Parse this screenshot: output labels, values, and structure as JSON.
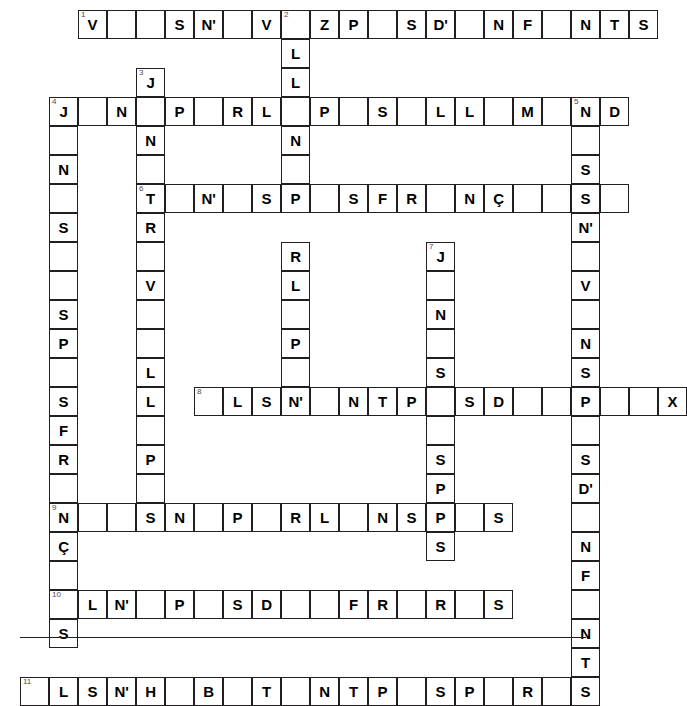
{
  "meta": {
    "grid": {
      "cell_size": 29,
      "origin_x": 20,
      "origin_y": 10,
      "columns": 20,
      "rows": 21
    },
    "colors": {
      "cell_border": "#231f20",
      "cell_fill": "#ffffff",
      "letter": "#000000",
      "clue_number": "#4a4a4a",
      "page_background": "#ffffff"
    }
  },
  "footer": {
    "rule": "horizontal-rule"
  },
  "entries": [
    {
      "label": "across-1",
      "number": "1",
      "row": 0,
      "col": 2,
      "direction": "across",
      "letters": [
        "V",
        "",
        "",
        "S",
        "N'",
        "",
        "V",
        "",
        "Z",
        "P",
        "",
        "S",
        "D'",
        "",
        "N",
        "F",
        "",
        "N",
        "T",
        "S"
      ]
    },
    {
      "label": "across-4",
      "number": "4",
      "row": 3,
      "col": 1,
      "direction": "across",
      "letters": [
        "J",
        "",
        "N",
        "",
        "P",
        "",
        "R",
        "L",
        "",
        "P",
        "",
        "S",
        "",
        "L",
        "L",
        "",
        "M",
        "",
        "N",
        "D"
      ]
    },
    {
      "label": "across-6",
      "number": "6",
      "row": 5,
      "col": 3,
      "direction": "across",
      "letters": [
        "T",
        "",
        "N'",
        "",
        "S",
        "P",
        "",
        "S",
        "F",
        "R",
        "",
        "N",
        "Ç",
        "",
        "",
        "S"
      ]
    },
    {
      "label": "across-8",
      "number": "8",
      "row": 11,
      "col": 5,
      "direction": "across",
      "letters": [
        "",
        "L",
        "S",
        "N'",
        "",
        "N",
        "T",
        "P",
        "",
        "S",
        "D",
        "",
        "P",
        "",
        "",
        "X"
      ]
    },
    {
      "label": "across-9",
      "number": "9",
      "row": 14,
      "col": 1,
      "direction": "across",
      "letters": [
        "N",
        "",
        "",
        "S",
        "N",
        "",
        "P",
        "",
        "R",
        "L",
        "",
        "N",
        "S",
        "P",
        "",
        "S"
      ]
    },
    {
      "label": "across-10",
      "number": "10",
      "row": 17,
      "col": 1,
      "direction": "across",
      "letters": [
        "",
        "L",
        "N'",
        "",
        "P",
        "",
        "S",
        "D",
        "",
        "",
        "F",
        "R",
        "",
        "R",
        "",
        "S"
      ]
    },
    {
      "label": "across-11",
      "number": "11",
      "row": 20,
      "col": 0,
      "direction": "across",
      "letters": [
        "",
        "L",
        "S",
        "N'",
        "H",
        "",
        "B",
        "",
        "T",
        "",
        "N",
        "T",
        "P",
        "",
        "S",
        "P",
        "",
        "R",
        "",
        "S"
      ]
    },
    {
      "label": "down-2",
      "number": "2",
      "row": 0,
      "col": 7,
      "direction": "down",
      "letters": [
        "",
        "L",
        "L",
        "",
        "N",
        "",
        "",
        "P",
        "",
        "",
        "R",
        "L",
        "",
        "P",
        "",
        "S"
      ]
    },
    {
      "label": "down-3",
      "number": "3",
      "row": 2,
      "col": 3,
      "direction": "down",
      "letters": [
        "J",
        "",
        "N",
        "",
        "T",
        "R",
        "",
        "V",
        "",
        "",
        "L",
        "L",
        "",
        "P",
        "",
        "S"
      ]
    },
    {
      "label": "down-4",
      "number": "4",
      "row": 3,
      "col": 1,
      "direction": "down",
      "letters": [
        "J",
        "",
        "N",
        "",
        "S",
        "",
        "",
        "S",
        "P",
        "",
        "S",
        "F",
        "R",
        "",
        "N",
        "Ç",
        "",
        "",
        "S"
      ]
    },
    {
      "label": "down-5",
      "number": "5",
      "row": 3,
      "col": 17,
      "direction": "down",
      "letters": [
        "N",
        "",
        "S",
        "N'",
        "",
        "V",
        "",
        "N",
        "S",
        "",
        "P",
        "",
        "",
        "S",
        "D'",
        "",
        "N",
        "F",
        "",
        "N",
        "T",
        "S"
      ]
    },
    {
      "label": "down-7",
      "number": "7",
      "row": 7,
      "col": 12,
      "direction": "down",
      "letters": [
        "J",
        "",
        "N",
        "",
        "S",
        "",
        "",
        "",
        "S",
        "P",
        "",
        "S",
        "",
        "",
        "S"
      ]
    }
  ],
  "cells": [
    {
      "r": 0,
      "c": 2,
      "n": "1",
      "l": "V"
    },
    {
      "r": 0,
      "c": 3,
      "n": "",
      "l": ""
    },
    {
      "r": 0,
      "c": 4,
      "n": "",
      "l": ""
    },
    {
      "r": 0,
      "c": 5,
      "n": "",
      "l": "S"
    },
    {
      "r": 0,
      "c": 6,
      "n": "",
      "l": "N'"
    },
    {
      "r": 0,
      "c": 7,
      "n": "",
      "l": ""
    },
    {
      "r": 0,
      "c": 8,
      "n": "",
      "l": "V"
    },
    {
      "r": 0,
      "c": 9,
      "n": "2",
      "l": ""
    },
    {
      "r": 0,
      "c": 10,
      "n": "",
      "l": "Z"
    },
    {
      "r": 0,
      "c": 11,
      "n": "",
      "l": "P"
    },
    {
      "r": 0,
      "c": 12,
      "n": "",
      "l": ""
    },
    {
      "r": 0,
      "c": 13,
      "n": "",
      "l": "S"
    },
    {
      "r": 0,
      "c": 14,
      "n": "",
      "l": "D'"
    },
    {
      "r": 0,
      "c": 15,
      "n": "",
      "l": ""
    },
    {
      "r": 0,
      "c": 16,
      "n": "",
      "l": "N"
    },
    {
      "r": 0,
      "c": 17,
      "n": "",
      "l": "F"
    },
    {
      "r": 0,
      "c": 18,
      "n": "",
      "l": ""
    },
    {
      "r": 0,
      "c": 19,
      "n": "",
      "l": "N"
    },
    {
      "r": 0,
      "c": 20,
      "n": "",
      "l": "T"
    },
    {
      "r": 0,
      "c": 21,
      "n": "",
      "l": "S"
    },
    {
      "r": 1,
      "c": 9,
      "n": "",
      "l": "L"
    },
    {
      "r": 2,
      "c": 9,
      "n": "",
      "l": "L"
    },
    {
      "r": 2,
      "c": 4,
      "n": "3",
      "l": "J"
    },
    {
      "r": 3,
      "c": 1,
      "n": "4",
      "l": "J"
    },
    {
      "r": 3,
      "c": 2,
      "n": "",
      "l": ""
    },
    {
      "r": 3,
      "c": 3,
      "n": "",
      "l": "N"
    },
    {
      "r": 3,
      "c": 4,
      "n": "",
      "l": ""
    },
    {
      "r": 3,
      "c": 5,
      "n": "",
      "l": "P"
    },
    {
      "r": 3,
      "c": 6,
      "n": "",
      "l": ""
    },
    {
      "r": 3,
      "c": 7,
      "n": "",
      "l": "R"
    },
    {
      "r": 3,
      "c": 8,
      "n": "",
      "l": "L"
    },
    {
      "r": 3,
      "c": 9,
      "n": "",
      "l": ""
    },
    {
      "r": 3,
      "c": 10,
      "n": "",
      "l": "P"
    },
    {
      "r": 3,
      "c": 11,
      "n": "",
      "l": ""
    },
    {
      "r": 3,
      "c": 12,
      "n": "",
      "l": "S"
    },
    {
      "r": 3,
      "c": 13,
      "n": "",
      "l": ""
    },
    {
      "r": 3,
      "c": 14,
      "n": "",
      "l": "L"
    },
    {
      "r": 3,
      "c": 15,
      "n": "",
      "l": "L"
    },
    {
      "r": 3,
      "c": 16,
      "n": "",
      "l": ""
    },
    {
      "r": 3,
      "c": 17,
      "n": "",
      "l": "M"
    },
    {
      "r": 3,
      "c": 18,
      "n": "",
      "l": ""
    },
    {
      "r": 3,
      "c": 19,
      "n": "5",
      "l": "N"
    },
    {
      "r": 3,
      "c": 20,
      "n": "",
      "l": "D"
    },
    {
      "r": 4,
      "c": 1,
      "n": "",
      "l": ""
    },
    {
      "r": 4,
      "c": 4,
      "n": "",
      "l": "N"
    },
    {
      "r": 4,
      "c": 9,
      "n": "",
      "l": "N"
    },
    {
      "r": 4,
      "c": 19,
      "n": "",
      "l": ""
    },
    {
      "r": 5,
      "c": 1,
      "n": "",
      "l": "N"
    },
    {
      "r": 5,
      "c": 4,
      "n": "",
      "l": ""
    },
    {
      "r": 5,
      "c": 9,
      "n": "",
      "l": ""
    },
    {
      "r": 5,
      "c": 19,
      "n": "",
      "l": "S"
    },
    {
      "r": 6,
      "c": 1,
      "n": "",
      "l": ""
    },
    {
      "r": 6,
      "c": 4,
      "n": "6",
      "l": "T"
    },
    {
      "r": 6,
      "c": 5,
      "n": "",
      "l": ""
    },
    {
      "r": 6,
      "c": 6,
      "n": "",
      "l": "N'"
    },
    {
      "r": 6,
      "c": 7,
      "n": "",
      "l": ""
    },
    {
      "r": 6,
      "c": 8,
      "n": "",
      "l": "S"
    },
    {
      "r": 6,
      "c": 9,
      "n": "",
      "l": "P"
    },
    {
      "r": 6,
      "c": 10,
      "n": "",
      "l": ""
    },
    {
      "r": 6,
      "c": 11,
      "n": "",
      "l": "S"
    },
    {
      "r": 6,
      "c": 12,
      "n": "",
      "l": "F"
    },
    {
      "r": 6,
      "c": 13,
      "n": "",
      "l": "R"
    },
    {
      "r": 6,
      "c": 14,
      "n": "",
      "l": ""
    },
    {
      "r": 6,
      "c": 15,
      "n": "",
      "l": "N"
    },
    {
      "r": 6,
      "c": 16,
      "n": "",
      "l": "Ç"
    },
    {
      "r": 6,
      "c": 17,
      "n": "",
      "l": ""
    },
    {
      "r": 6,
      "c": 18,
      "n": "",
      "l": ""
    },
    {
      "r": 6,
      "c": 19,
      "n": "",
      "l": "S"
    },
    {
      "r": 6,
      "c": 20,
      "n": "",
      "l": ""
    },
    {
      "r": 7,
      "c": 1,
      "n": "",
      "l": "S"
    },
    {
      "r": 7,
      "c": 4,
      "n": "",
      "l": "R"
    },
    {
      "r": 7,
      "c": 19,
      "n": "",
      "l": "N'"
    },
    {
      "r": 8,
      "c": 1,
      "n": "",
      "l": ""
    },
    {
      "r": 8,
      "c": 4,
      "n": "",
      "l": ""
    },
    {
      "r": 8,
      "c": 9,
      "n": "",
      "l": "R"
    },
    {
      "r": 8,
      "c": 14,
      "n": "7",
      "l": "J"
    },
    {
      "r": 8,
      "c": 19,
      "n": "",
      "l": ""
    },
    {
      "r": 9,
      "c": 1,
      "n": "",
      "l": ""
    },
    {
      "r": 9,
      "c": 4,
      "n": "",
      "l": "V"
    },
    {
      "r": 9,
      "c": 9,
      "n": "",
      "l": "L"
    },
    {
      "r": 9,
      "c": 14,
      "n": "",
      "l": ""
    },
    {
      "r": 9,
      "c": 19,
      "n": "",
      "l": "V"
    },
    {
      "r": 10,
      "c": 1,
      "n": "",
      "l": "S"
    },
    {
      "r": 10,
      "c": 4,
      "n": "",
      "l": ""
    },
    {
      "r": 10,
      "c": 9,
      "n": "",
      "l": ""
    },
    {
      "r": 10,
      "c": 14,
      "n": "",
      "l": "N"
    },
    {
      "r": 10,
      "c": 19,
      "n": "",
      "l": ""
    },
    {
      "r": 11,
      "c": 1,
      "n": "",
      "l": "P"
    },
    {
      "r": 11,
      "c": 4,
      "n": "",
      "l": ""
    },
    {
      "r": 11,
      "c": 9,
      "n": "",
      "l": "P"
    },
    {
      "r": 11,
      "c": 14,
      "n": "",
      "l": ""
    },
    {
      "r": 11,
      "c": 19,
      "n": "",
      "l": "N"
    },
    {
      "r": 12,
      "c": 1,
      "n": "",
      "l": ""
    },
    {
      "r": 12,
      "c": 4,
      "n": "",
      "l": "L"
    },
    {
      "r": 12,
      "c": 9,
      "n": "",
      "l": ""
    },
    {
      "r": 12,
      "c": 14,
      "n": "",
      "l": "S"
    },
    {
      "r": 12,
      "c": 19,
      "n": "",
      "l": "S"
    },
    {
      "r": 13,
      "c": 1,
      "n": "",
      "l": "S"
    },
    {
      "r": 13,
      "c": 4,
      "n": "",
      "l": "L"
    },
    {
      "r": 13,
      "c": 6,
      "n": "8",
      "l": ""
    },
    {
      "r": 13,
      "c": 7,
      "n": "",
      "l": "L"
    },
    {
      "r": 13,
      "c": 8,
      "n": "",
      "l": "S"
    },
    {
      "r": 13,
      "c": 9,
      "n": "",
      "l": "N'"
    },
    {
      "r": 13,
      "c": 10,
      "n": "",
      "l": ""
    },
    {
      "r": 13,
      "c": 11,
      "n": "",
      "l": "N"
    },
    {
      "r": 13,
      "c": 12,
      "n": "",
      "l": "T"
    },
    {
      "r": 13,
      "c": 13,
      "n": "",
      "l": "P"
    },
    {
      "r": 13,
      "c": 14,
      "n": "",
      "l": ""
    },
    {
      "r": 13,
      "c": 15,
      "n": "",
      "l": "S"
    },
    {
      "r": 13,
      "c": 16,
      "n": "",
      "l": "D"
    },
    {
      "r": 13,
      "c": 17,
      "n": "",
      "l": ""
    },
    {
      "r": 13,
      "c": 18,
      "n": "",
      "l": ""
    },
    {
      "r": 13,
      "c": 19,
      "n": "",
      "l": "P"
    },
    {
      "r": 13,
      "c": 20,
      "n": "",
      "l": ""
    },
    {
      "r": 13,
      "c": 21,
      "n": "",
      "l": ""
    },
    {
      "r": 13,
      "c": 22,
      "n": "",
      "l": "X"
    },
    {
      "r": 14,
      "c": 1,
      "n": "",
      "l": "F"
    },
    {
      "r": 14,
      "c": 4,
      "n": "",
      "l": ""
    },
    {
      "r": 14,
      "c": 14,
      "n": "",
      "l": ""
    },
    {
      "r": 14,
      "c": 19,
      "n": "",
      "l": ""
    },
    {
      "r": 15,
      "c": 1,
      "n": "",
      "l": "R"
    },
    {
      "r": 15,
      "c": 4,
      "n": "",
      "l": "P"
    },
    {
      "r": 15,
      "c": 14,
      "n": "",
      "l": "S"
    },
    {
      "r": 15,
      "c": 19,
      "n": "",
      "l": "S"
    },
    {
      "r": 16,
      "c": 1,
      "n": "",
      "l": ""
    },
    {
      "r": 16,
      "c": 4,
      "n": "",
      "l": ""
    },
    {
      "r": 16,
      "c": 14,
      "n": "",
      "l": "P"
    },
    {
      "r": 16,
      "c": 19,
      "n": "",
      "l": "D'"
    },
    {
      "r": 17,
      "c": 1,
      "n": "9",
      "l": "N"
    },
    {
      "r": 17,
      "c": 2,
      "n": "",
      "l": ""
    },
    {
      "r": 17,
      "c": 3,
      "n": "",
      "l": ""
    },
    {
      "r": 17,
      "c": 4,
      "n": "",
      "l": "S"
    },
    {
      "r": 17,
      "c": 5,
      "n": "",
      "l": "N"
    },
    {
      "r": 17,
      "c": 6,
      "n": "",
      "l": ""
    },
    {
      "r": 17,
      "c": 7,
      "n": "",
      "l": "P"
    },
    {
      "r": 17,
      "c": 8,
      "n": "",
      "l": ""
    },
    {
      "r": 17,
      "c": 9,
      "n": "",
      "l": "R"
    },
    {
      "r": 17,
      "c": 10,
      "n": "",
      "l": "L"
    },
    {
      "r": 17,
      "c": 11,
      "n": "",
      "l": ""
    },
    {
      "r": 17,
      "c": 12,
      "n": "",
      "l": "N"
    },
    {
      "r": 17,
      "c": 13,
      "n": "",
      "l": "S"
    },
    {
      "r": 17,
      "c": 14,
      "n": "",
      "l": "P"
    },
    {
      "r": 17,
      "c": 15,
      "n": "",
      "l": ""
    },
    {
      "r": 17,
      "c": 16,
      "n": "",
      "l": "S"
    },
    {
      "r": 17,
      "c": 19,
      "n": "",
      "l": ""
    },
    {
      "r": 18,
      "c": 1,
      "n": "",
      "l": "Ç"
    },
    {
      "r": 18,
      "c": 14,
      "n": "",
      "l": "S"
    },
    {
      "r": 18,
      "c": 19,
      "n": "",
      "l": "N"
    },
    {
      "r": 19,
      "c": 1,
      "n": "",
      "l": ""
    },
    {
      "r": 19,
      "c": 19,
      "n": "",
      "l": "F"
    },
    {
      "r": 20,
      "c": 1,
      "n": "10",
      "l": ""
    },
    {
      "r": 20,
      "c": 2,
      "n": "",
      "l": "L"
    },
    {
      "r": 20,
      "c": 3,
      "n": "",
      "l": "N'"
    },
    {
      "r": 20,
      "c": 4,
      "n": "",
      "l": ""
    },
    {
      "r": 20,
      "c": 5,
      "n": "",
      "l": "P"
    },
    {
      "r": 20,
      "c": 6,
      "n": "",
      "l": ""
    },
    {
      "r": 20,
      "c": 7,
      "n": "",
      "l": "S"
    },
    {
      "r": 20,
      "c": 8,
      "n": "",
      "l": "D"
    },
    {
      "r": 20,
      "c": 9,
      "n": "",
      "l": ""
    },
    {
      "r": 20,
      "c": 10,
      "n": "",
      "l": ""
    },
    {
      "r": 20,
      "c": 11,
      "n": "",
      "l": "F"
    },
    {
      "r": 20,
      "c": 12,
      "n": "",
      "l": "R"
    },
    {
      "r": 20,
      "c": 13,
      "n": "",
      "l": ""
    },
    {
      "r": 20,
      "c": 14,
      "n": "",
      "l": "R"
    },
    {
      "r": 20,
      "c": 15,
      "n": "",
      "l": ""
    },
    {
      "r": 20,
      "c": 16,
      "n": "",
      "l": "S"
    },
    {
      "r": 20,
      "c": 19,
      "n": "",
      "l": ""
    },
    {
      "r": 21,
      "c": 1,
      "n": "",
      "l": "S"
    },
    {
      "r": 21,
      "c": 19,
      "n": "",
      "l": "N"
    },
    {
      "r": 22,
      "c": 19,
      "n": "",
      "l": "T"
    },
    {
      "r": 23,
      "c": 0,
      "n": "11",
      "l": ""
    },
    {
      "r": 23,
      "c": 1,
      "n": "",
      "l": "L"
    },
    {
      "r": 23,
      "c": 2,
      "n": "",
      "l": "S"
    },
    {
      "r": 23,
      "c": 3,
      "n": "",
      "l": "N'"
    },
    {
      "r": 23,
      "c": 4,
      "n": "",
      "l": "H"
    },
    {
      "r": 23,
      "c": 5,
      "n": "",
      "l": ""
    },
    {
      "r": 23,
      "c": 6,
      "n": "",
      "l": "B"
    },
    {
      "r": 23,
      "c": 7,
      "n": "",
      "l": ""
    },
    {
      "r": 23,
      "c": 8,
      "n": "",
      "l": "T"
    },
    {
      "r": 23,
      "c": 9,
      "n": "",
      "l": ""
    },
    {
      "r": 23,
      "c": 10,
      "n": "",
      "l": "N"
    },
    {
      "r": 23,
      "c": 11,
      "n": "",
      "l": "T"
    },
    {
      "r": 23,
      "c": 12,
      "n": "",
      "l": "P"
    },
    {
      "r": 23,
      "c": 13,
      "n": "",
      "l": ""
    },
    {
      "r": 23,
      "c": 14,
      "n": "",
      "l": "S"
    },
    {
      "r": 23,
      "c": 15,
      "n": "",
      "l": "P"
    },
    {
      "r": 23,
      "c": 16,
      "n": "",
      "l": ""
    },
    {
      "r": 23,
      "c": 17,
      "n": "",
      "l": "R"
    },
    {
      "r": 23,
      "c": 18,
      "n": "",
      "l": ""
    },
    {
      "r": 23,
      "c": 19,
      "n": "",
      "l": "S"
    }
  ]
}
